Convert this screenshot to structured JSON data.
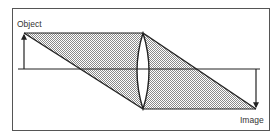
{
  "diagram": {
    "type": "thin-lens ray diagram",
    "labels": {
      "object": "Object",
      "image": "Image"
    },
    "colors": {
      "line": "#222222",
      "frame": "#555555",
      "shade": "#bdbdbd",
      "background": "#ffffff"
    },
    "elements": {
      "object_arrow": {
        "x": 24,
        "base_y": 69,
        "tip_y": 33,
        "direction": "up"
      },
      "image_arrow": {
        "x": 256,
        "base_y": 69,
        "tip_y": 109,
        "direction": "down"
      },
      "optical_axis": {
        "y": 69,
        "x_start": 18,
        "x_end": 260
      },
      "lens": {
        "type": "biconvex",
        "cx": 143,
        "top_y": 33,
        "bottom_y": 109,
        "half_width": 12
      },
      "rays": [
        {
          "from": [
            24,
            33
          ],
          "via": [
            143,
            33
          ],
          "to": [
            256,
            109
          ]
        },
        {
          "from": [
            24,
            33
          ],
          "via": [
            143,
            109
          ],
          "to": [
            256,
            109
          ]
        }
      ]
    }
  }
}
